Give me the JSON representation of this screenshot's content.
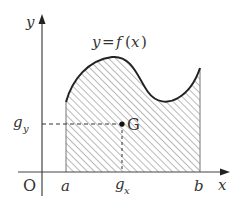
{
  "figure": {
    "curve_label": "y = f(x)",
    "curve_label_parts": {
      "y": "y",
      "eq": "=",
      "f": "f",
      "lp": "(",
      "x": "x",
      "rp": ")"
    },
    "axes": {
      "y_label": "y",
      "x_label": "x",
      "origin_label": "O"
    },
    "ticks": {
      "a": "a",
      "b": "b",
      "gx": "g",
      "gx_sub": "x",
      "gy": "g",
      "gy_sub": "y"
    },
    "centroid_label": "G",
    "colors": {
      "ink": "#333333",
      "hatch": "#888888",
      "background": "#ffffff"
    }
  }
}
